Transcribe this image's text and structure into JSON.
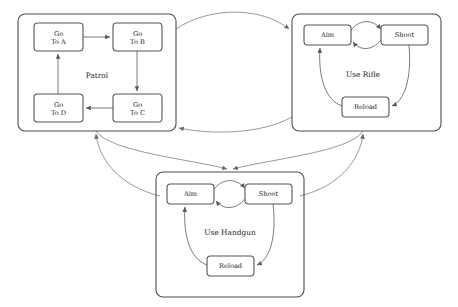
{
  "diagram": {
    "type": "hierarchical-state-machine",
    "title": "",
    "canvas": {
      "width": 458,
      "height": 307
    },
    "groups": [
      {
        "id": "patrol",
        "label": "Patrol",
        "label_x": 97,
        "label_y": 78,
        "x": 18,
        "y": 14,
        "w": 158,
        "h": 117,
        "nodes": [
          {
            "id": "go-to-a",
            "line1": "Go",
            "line2": "To A",
            "x": 34,
            "y": 23,
            "w": 49,
            "h": 28
          },
          {
            "id": "go-to-b",
            "line1": "Go",
            "line2": "To B",
            "x": 113,
            "y": 23,
            "w": 49,
            "h": 28
          },
          {
            "id": "go-to-c",
            "line1": "Go",
            "line2": "To C",
            "x": 113,
            "y": 94,
            "w": 49,
            "h": 28
          },
          {
            "id": "go-to-d",
            "line1": "Go",
            "line2": "To D",
            "x": 34,
            "y": 94,
            "w": 49,
            "h": 28
          }
        ]
      },
      {
        "id": "use-rifle",
        "label": "Use Rifle",
        "label_x": 363,
        "label_y": 77,
        "x": 292,
        "y": 14,
        "w": 149,
        "h": 117,
        "nodes": [
          {
            "id": "rifle-aim",
            "line1": "Aim",
            "line2": "",
            "x": 304,
            "y": 25,
            "w": 47,
            "h": 20
          },
          {
            "id": "rifle-shoot",
            "line1": "Shoot",
            "line2": "",
            "x": 381,
            "y": 25,
            "w": 47,
            "h": 20
          },
          {
            "id": "rifle-reload",
            "line1": "Reload",
            "line2": "",
            "x": 342,
            "y": 97,
            "w": 47,
            "h": 20
          }
        ]
      },
      {
        "id": "use-handgun",
        "label": "Use Handgun",
        "label_x": 230,
        "label_y": 235,
        "x": 156,
        "y": 172,
        "w": 148,
        "h": 125,
        "nodes": [
          {
            "id": "handgun-aim",
            "line1": "Aim",
            "line2": "",
            "x": 167,
            "y": 184,
            "w": 47,
            "h": 20
          },
          {
            "id": "handgun-shoot",
            "line1": "Shoot",
            "line2": "",
            "x": 245,
            "y": 184,
            "w": 47,
            "h": 20
          },
          {
            "id": "handgun-reload",
            "line1": "Reload",
            "line2": "",
            "x": 207,
            "y": 256,
            "w": 47,
            "h": 20
          }
        ]
      }
    ],
    "edges_inner": [
      {
        "id": "a-to-b",
        "d": "M 83 37 L 110 37"
      },
      {
        "id": "b-to-c",
        "d": "M 137 51 L 137 91"
      },
      {
        "id": "c-to-d",
        "d": "M 113 108 L 86 108"
      },
      {
        "id": "d-to-a",
        "d": "M 58 94 L 58 54"
      },
      {
        "id": "rifle-aim-to-shoot",
        "d": "M 351 30 C 360 19, 372 19, 381 29"
      },
      {
        "id": "rifle-shoot-to-aim",
        "d": "M 381 40 C 372 51, 360 51, 353 42"
      },
      {
        "id": "rifle-shoot-to-reload",
        "d": "M 409 45 C 412 80, 404 101, 392 106"
      },
      {
        "id": "rifle-reload-to-aim",
        "d": "M 342 106 C 325 100, 318 76, 320 48"
      },
      {
        "id": "handgun-aim-to-shoot",
        "d": "M 214 189 C 223 178, 236 178, 245 188"
      },
      {
        "id": "handgun-shoot-to-aim",
        "d": "M 245 199 C 236 210, 223 210, 216 201"
      },
      {
        "id": "handgun-shoot-to-reload",
        "d": "M 273 204 C 277 239, 269 260, 257 265"
      },
      {
        "id": "handgun-reload-to-aim",
        "d": "M 207 265 C 190 259, 183 235, 185 207"
      }
    ],
    "edges_outer": [
      {
        "id": "patrol-to-rifle",
        "from": "patrol",
        "to": "use-rifle",
        "d": "M 176 29 C 210 6, 262 7, 289 29"
      },
      {
        "id": "rifle-to-patrol",
        "from": "use-rifle",
        "to": "patrol",
        "d": "M 292 117 C 262 134, 212 135, 179 128"
      },
      {
        "id": "handgun-to-patrol",
        "from": "use-handgun",
        "to": "patrol",
        "d": "M 160 196 C 120 186, 99 160, 96 134"
      },
      {
        "id": "patrol-to-handgun",
        "from": "patrol",
        "to": "use-handgun",
        "d": "M 96 131 C 110 152, 190 159, 227 169"
      },
      {
        "id": "rifle-to-handgun",
        "from": "use-rifle",
        "to": "use-handgun",
        "d": "M 363 131 C 350 152, 270 159, 233 169"
      },
      {
        "id": "handgun-to-rifle",
        "from": "use-handgun",
        "to": "use-rifle",
        "d": "M 300 196 C 340 186, 360 160, 363 134"
      }
    ]
  }
}
